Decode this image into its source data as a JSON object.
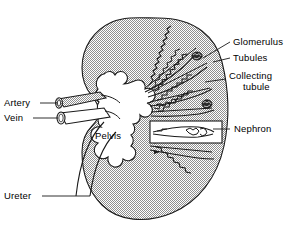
{
  "figure": {
    "background_color": "#ffffff",
    "ink_color": "#1a1a1a",
    "fill_tone": "#c8c8c8"
  },
  "labels": {
    "glomerulus": "Glomerulus",
    "tubules": "Tubules",
    "collecting_tubule_line1": "Collecting",
    "collecting_tubule_line2": "tubule",
    "nephron": "Nephron",
    "artery": "Artery",
    "vein": "Vein",
    "pelvis": "Pelvis",
    "ureter": "Ureter"
  },
  "structures": {
    "kidney_capsule": "kidney-outline",
    "renal_pelvis": "renal-pelvis-cavity",
    "renal_artery": "renal-artery-vessel",
    "renal_vein": "renal-vein-vessel",
    "ureter_tube": "ureter-tube",
    "nephron_callout": "nephron-magnified-box",
    "nephron_units": 5,
    "glomerulus_clusters": 3
  }
}
